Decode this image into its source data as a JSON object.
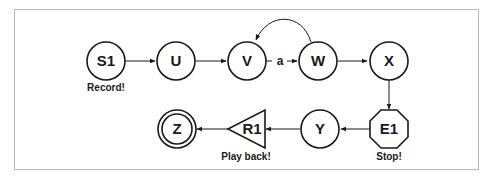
{
  "diagram": {
    "type": "state-machine",
    "nodes": {
      "s1": {
        "label": "S1",
        "shape": "circle",
        "caption": "Record!"
      },
      "u": {
        "label": "U",
        "shape": "circle"
      },
      "v": {
        "label": "V",
        "shape": "circle"
      },
      "w": {
        "label": "W",
        "shape": "circle"
      },
      "x": {
        "label": "X",
        "shape": "circle"
      },
      "e1": {
        "label": "E1",
        "shape": "octagon",
        "caption": "Stop!"
      },
      "y": {
        "label": "Y",
        "shape": "circle"
      },
      "r1": {
        "label": "R1",
        "shape": "triangle",
        "caption": "Play back!"
      },
      "z": {
        "label": "Z",
        "shape": "double-circle"
      }
    },
    "edges": [
      {
        "from": "S1",
        "to": "U",
        "label": ""
      },
      {
        "from": "U",
        "to": "V",
        "label": ""
      },
      {
        "from": "V",
        "to": "W",
        "label": "a"
      },
      {
        "from": "W",
        "to": "V",
        "label": ""
      },
      {
        "from": "W",
        "to": "X",
        "label": ""
      },
      {
        "from": "X",
        "to": "E1",
        "label": ""
      },
      {
        "from": "E1",
        "to": "Y",
        "label": ""
      },
      {
        "from": "Y",
        "to": "R1",
        "label": ""
      },
      {
        "from": "R1",
        "to": "Z",
        "label": ""
      }
    ],
    "edge_labels": {
      "v_to_w": "a"
    },
    "colors": {
      "stroke": "#1a1a1a",
      "frame": "#b8b8b8",
      "background": "#ffffff"
    }
  }
}
